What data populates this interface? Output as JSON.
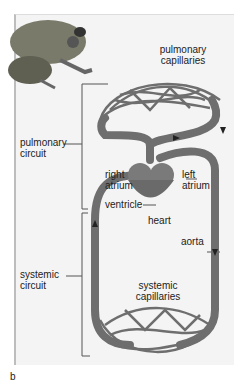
{
  "labels": {
    "pulmonary_capillaries": [
      "pulmonary",
      "capillaries"
    ],
    "pulmonary_circuit": [
      "pulmonary",
      "circuit"
    ],
    "right_atrium": [
      "right",
      "atrium"
    ],
    "left_atrium": [
      "left",
      "atrium"
    ],
    "ventricle": "ventricle",
    "heart": "heart",
    "aorta": "aorta",
    "systemic_circuit": [
      "systemic",
      "circuit"
    ],
    "systemic_capillaries": [
      "systemic",
      "capillaries"
    ],
    "panel_letter": "b"
  },
  "colors": {
    "vessel": "#6e6e6e",
    "vessel_dark": "#4a4a4a",
    "background": "#f4f4f4"
  }
}
